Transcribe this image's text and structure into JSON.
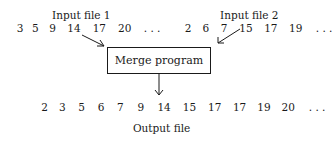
{
  "diagram": {
    "input1": {
      "label": "Input file 1",
      "values": [
        "3",
        "5",
        "9",
        "14",
        "17",
        "20",
        ". . ."
      ]
    },
    "input2": {
      "label": "Input file 2",
      "values": [
        "2",
        "6",
        "7",
        "15",
        "17",
        "19",
        ". . ."
      ]
    },
    "process": {
      "label": "Merge program"
    },
    "output": {
      "label": "Output file",
      "values": [
        "2",
        "3",
        "5",
        "6",
        "7",
        "9",
        "14",
        "15",
        "17",
        "17",
        "19",
        "20",
        ". . ."
      ]
    }
  }
}
